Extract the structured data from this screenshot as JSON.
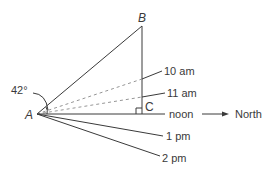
{
  "diagram": {
    "vertices": {
      "A": "A",
      "B": "B",
      "C": "C"
    },
    "angle_label": "42°",
    "time_labels": {
      "ten_am": "10 am",
      "eleven_am": "11 am",
      "noon": "noon",
      "one_pm": "1 pm",
      "two_pm": "2 pm"
    },
    "direction_label": "North",
    "colors": {
      "line": "#3a3a3a",
      "dashed": "#8a8a8a",
      "background": "#ffffff"
    }
  }
}
